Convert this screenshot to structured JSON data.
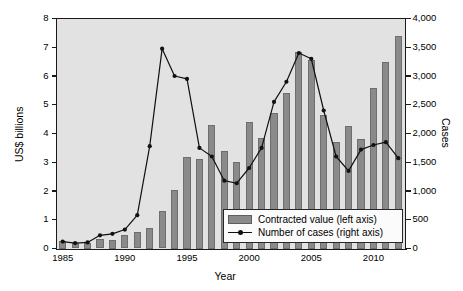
{
  "chart_data": {
    "type": "bar",
    "title": "",
    "xlabel": "Year",
    "ylabel": "US$ billions",
    "y2label": "Cases",
    "grid": false,
    "legend_position": "inside-bottom-right",
    "ylim": [
      0,
      8
    ],
    "y2lim": [
      0,
      4000
    ],
    "xlim": [
      1984.5,
      2012.5
    ],
    "yticks": [
      "0",
      "1",
      "2",
      "3",
      "4",
      "5",
      "6",
      "7",
      "8"
    ],
    "ytick_values": [
      0,
      1,
      2,
      3,
      4,
      5,
      6,
      7,
      8
    ],
    "y2ticks": [
      "0",
      "500",
      "1,000",
      "1,500",
      "2,000",
      "2,500",
      "3,000",
      "3,500",
      "4,000"
    ],
    "y2tick_values": [
      0,
      500,
      1000,
      1500,
      2000,
      2500,
      3000,
      3500,
      4000
    ],
    "xticks": [
      "1985",
      "1990",
      "1995",
      "2000",
      "2005",
      "2010"
    ],
    "xtick_values": [
      1985,
      1990,
      1995,
      2000,
      2005,
      2010
    ],
    "categories": [
      1985,
      1986,
      1987,
      1988,
      1989,
      1990,
      1991,
      1992,
      1993,
      1994,
      1995,
      1996,
      1997,
      1998,
      1999,
      2000,
      2001,
      2002,
      2003,
      2004,
      2005,
      2006,
      2007,
      2008,
      2009,
      2010,
      2011,
      2012
    ],
    "series": [
      {
        "name": "Contracted value (left axis)",
        "axis": "left",
        "type": "bar",
        "unit": "US$ billions",
        "color": "#8a8a8a",
        "values": [
          0.25,
          0.18,
          0.2,
          0.32,
          0.3,
          0.47,
          0.56,
          0.7,
          1.32,
          2.05,
          3.2,
          3.1,
          4.3,
          3.4,
          3.0,
          4.4,
          3.85,
          4.7,
          5.4,
          6.85,
          6.55,
          4.65,
          3.7,
          4.25,
          3.8,
          5.6,
          6.5,
          7.4
        ]
      },
      {
        "name": "Number of cases (right axis)",
        "axis": "right",
        "type": "line",
        "unit": "Cases",
        "color": "#111111",
        "marker": "filled-circle",
        "values": [
          120,
          95,
          105,
          230,
          255,
          330,
          580,
          1780,
          3475,
          3000,
          2950,
          1750,
          1600,
          1180,
          1135,
          1400,
          1750,
          2550,
          2900,
          3400,
          3300,
          2400,
          1600,
          1350,
          1720,
          1800,
          1850,
          1570
        ]
      }
    ]
  },
  "legend": {
    "items": [
      {
        "label": "Contracted value (left axis)",
        "marker": "swatch"
      },
      {
        "label": "Number of cases (right axis)",
        "marker": "line-dot"
      }
    ]
  },
  "axes": {
    "y_left_title": "US$ billions",
    "y_right_title": "Cases",
    "x_title": "Year"
  },
  "colors": {
    "bar_fill": "#8a8a8a",
    "bar_stroke": "#6e6e6e",
    "line": "#111111",
    "plot_background": "#e2e2e2",
    "page_background": "#ffffff",
    "axis": "#1a1a1a"
  }
}
